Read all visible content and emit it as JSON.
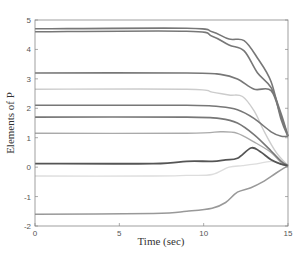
{
  "chart_data": {
    "type": "line",
    "title": "",
    "xlabel": "Time (sec)",
    "ylabel": "Elements of P",
    "xlim": [
      0,
      15
    ],
    "ylim": [
      -2,
      5
    ],
    "xticks": [
      0,
      5,
      10,
      15
    ],
    "yticks": [
      -2,
      -1,
      0,
      1,
      2,
      3,
      4,
      5
    ],
    "grid": false,
    "legend": null,
    "series": [
      {
        "name": "P1",
        "color": "#777777",
        "width": 1.6,
        "points": [
          [
            0,
            4.7
          ],
          [
            9,
            4.72
          ],
          [
            10.5,
            4.6
          ],
          [
            11.5,
            4.35
          ],
          [
            12.4,
            4.3
          ],
          [
            13.2,
            3.7
          ],
          [
            14,
            2.9
          ],
          [
            14.6,
            1.6
          ],
          [
            15,
            1.05
          ]
        ]
      },
      {
        "name": "P2",
        "color": "#777777",
        "width": 1.6,
        "points": [
          [
            0,
            4.6
          ],
          [
            9,
            4.62
          ],
          [
            10.5,
            4.45
          ],
          [
            11.5,
            4.15
          ],
          [
            12.4,
            3.95
          ],
          [
            13.2,
            3.2
          ],
          [
            14,
            2.7
          ],
          [
            14.6,
            1.8
          ],
          [
            15,
            1.05
          ]
        ]
      },
      {
        "name": "P3",
        "color": "#777777",
        "width": 1.6,
        "points": [
          [
            0,
            3.2
          ],
          [
            9,
            3.2
          ],
          [
            11,
            3.15
          ],
          [
            12,
            3.0
          ],
          [
            13,
            2.65
          ],
          [
            14,
            2.6
          ],
          [
            14.6,
            1.7
          ],
          [
            15,
            1.05
          ]
        ]
      },
      {
        "name": "P4",
        "color": "#cccccc",
        "width": 1.4,
        "points": [
          [
            0,
            2.65
          ],
          [
            9,
            2.65
          ],
          [
            10.5,
            2.55
          ],
          [
            11.5,
            2.45
          ],
          [
            12.3,
            2.4
          ],
          [
            13,
            1.9
          ],
          [
            13.6,
            1.2
          ],
          [
            14.3,
            0.5
          ],
          [
            15,
            0.05
          ]
        ]
      },
      {
        "name": "P5",
        "color": "#777777",
        "width": 1.6,
        "points": [
          [
            0,
            2.1
          ],
          [
            9,
            2.1
          ],
          [
            11,
            2.05
          ],
          [
            12,
            1.95
          ],
          [
            13,
            1.65
          ],
          [
            14,
            1.2
          ],
          [
            14.6,
            1.05
          ],
          [
            15,
            1.05
          ]
        ]
      },
      {
        "name": "P6",
        "color": "#777777",
        "width": 1.6,
        "points": [
          [
            0,
            1.7
          ],
          [
            9,
            1.7
          ],
          [
            11,
            1.65
          ],
          [
            12,
            1.5
          ],
          [
            13,
            1.1
          ],
          [
            14,
            0.55
          ],
          [
            14.6,
            0.2
          ],
          [
            15,
            0.05
          ]
        ]
      },
      {
        "name": "P7",
        "color": "#aaaaaa",
        "width": 1.4,
        "points": [
          [
            0,
            1.15
          ],
          [
            9,
            1.15
          ],
          [
            11,
            1.2
          ],
          [
            12,
            1.15
          ],
          [
            13,
            0.85
          ],
          [
            14,
            0.5
          ],
          [
            14.6,
            0.15
          ],
          [
            15,
            0.05
          ]
        ]
      },
      {
        "name": "P8",
        "color": "#555555",
        "width": 1.8,
        "points": [
          [
            0,
            0.12
          ],
          [
            7,
            0.12
          ],
          [
            9,
            0.2
          ],
          [
            10.5,
            0.2
          ],
          [
            11.3,
            0.25
          ],
          [
            12,
            0.3
          ],
          [
            12.8,
            0.65
          ],
          [
            13.3,
            0.55
          ],
          [
            14,
            0.25
          ],
          [
            14.6,
            0.1
          ],
          [
            15,
            0.05
          ]
        ]
      },
      {
        "name": "P9",
        "color": "#dddddd",
        "width": 1.3,
        "points": [
          [
            0,
            -0.3
          ],
          [
            7,
            -0.3
          ],
          [
            9,
            -0.28
          ],
          [
            10.5,
            -0.25
          ],
          [
            11.5,
            0.0
          ],
          [
            12.3,
            0.05
          ],
          [
            13,
            0.1
          ],
          [
            14,
            0.2
          ],
          [
            14.6,
            0.1
          ],
          [
            15,
            0.05
          ]
        ]
      },
      {
        "name": "P10",
        "color": "#999999",
        "width": 1.5,
        "points": [
          [
            0,
            -1.6
          ],
          [
            7,
            -1.58
          ],
          [
            9,
            -1.5
          ],
          [
            10.5,
            -1.4
          ],
          [
            11.3,
            -1.2
          ],
          [
            12,
            -0.85
          ],
          [
            12.8,
            -0.7
          ],
          [
            13.5,
            -0.5
          ],
          [
            14.3,
            -0.2
          ],
          [
            15,
            0.05
          ]
        ]
      }
    ]
  }
}
